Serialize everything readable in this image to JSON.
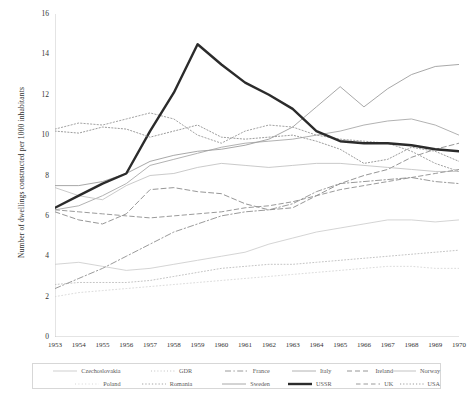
{
  "chart_data": {
    "type": "line",
    "title": "",
    "xlabel": "",
    "ylabel": "Number of dwellings constructed per 1000 inhabitants",
    "x": [
      1953,
      1954,
      1955,
      1956,
      1957,
      1958,
      1959,
      1960,
      1961,
      1962,
      1963,
      1964,
      1965,
      1966,
      1967,
      1968,
      1969,
      1970
    ],
    "xtick_labels": [
      "1953",
      "1954",
      "1955",
      "1956",
      "1957",
      "1958",
      "1959",
      "1960",
      "1961",
      "1962",
      "1963",
      "1964",
      "1965",
      "1966",
      "1967",
      "1968",
      "1969",
      "1970"
    ],
    "ylim": [
      0,
      16
    ],
    "ytick_labels": [
      "0",
      "2",
      "4",
      "6",
      "8",
      "10",
      "12",
      "14",
      "16"
    ],
    "yticks": [
      0,
      2,
      4,
      6,
      8,
      10,
      12,
      14,
      16
    ],
    "grid": false,
    "legend_position": "below-plot",
    "series": [
      {
        "name": "Czechoslovakia",
        "style": "solid-light",
        "color": "#c9c9c9",
        "width": 0.8,
        "values": [
          3.6,
          3.7,
          3.5,
          3.3,
          3.4,
          3.6,
          3.8,
          4.0,
          4.2,
          4.6,
          4.9,
          5.2,
          5.4,
          5.6,
          5.8,
          5.8,
          5.7,
          5.8
        ]
      },
      {
        "name": "GDR",
        "style": "dotted-light",
        "color": "#bdbdbd",
        "width": 0.9,
        "values": [
          2.6,
          2.7,
          2.7,
          2.7,
          2.8,
          3.0,
          3.2,
          3.4,
          3.5,
          3.6,
          3.6,
          3.7,
          3.8,
          3.9,
          4.0,
          4.1,
          4.2,
          4.3
        ]
      },
      {
        "name": "France",
        "style": "dashdot",
        "color": "#8f8f8f",
        "width": 0.9,
        "values": [
          2.4,
          2.9,
          3.4,
          4.0,
          4.6,
          5.2,
          5.6,
          6.0,
          6.2,
          6.3,
          6.6,
          7.2,
          7.6,
          7.7,
          7.8,
          7.9,
          7.7,
          7.6
        ]
      },
      {
        "name": "Italy",
        "style": "solid-mid",
        "color": "#a9a9a9",
        "width": 0.9,
        "values": [
          6.3,
          6.5,
          7.0,
          7.6,
          8.5,
          8.8,
          9.1,
          9.4,
          9.6,
          9.7,
          9.8,
          10.0,
          10.2,
          10.5,
          10.7,
          10.8,
          10.5,
          10.0
        ]
      },
      {
        "name": "Ireland",
        "style": "dashed",
        "color": "#8a8a8a",
        "width": 0.9,
        "values": [
          6.2,
          5.8,
          5.6,
          6.1,
          7.3,
          7.4,
          7.2,
          7.1,
          6.6,
          6.3,
          6.4,
          7.0,
          7.6,
          8.0,
          8.3,
          8.9,
          9.3,
          9.6
        ]
      },
      {
        "name": "Norway",
        "style": "solid-thin",
        "color": "#bcbcbc",
        "width": 0.8,
        "values": [
          7.4,
          7.0,
          6.8,
          7.5,
          8.0,
          8.1,
          8.4,
          8.6,
          8.5,
          8.4,
          8.5,
          8.6,
          8.6,
          8.5,
          8.4,
          8.3,
          8.2,
          8.2
        ]
      },
      {
        "name": "Poland",
        "style": "dotted-faint",
        "color": "#d2d2d2",
        "width": 0.8,
        "values": [
          2.0,
          2.2,
          2.3,
          2.4,
          2.5,
          2.6,
          2.7,
          2.8,
          2.9,
          3.0,
          3.1,
          3.2,
          3.3,
          3.4,
          3.5,
          3.5,
          3.4,
          3.4
        ]
      },
      {
        "name": "Romania",
        "style": "dotted-mid",
        "color": "#a5a5a5",
        "width": 1.0,
        "values": [
          10.3,
          10.6,
          10.5,
          10.8,
          11.1,
          10.8,
          10.0,
          9.6,
          10.2,
          10.5,
          10.4,
          10.0,
          9.8,
          9.7,
          9.6,
          9.2,
          8.6,
          8.2
        ]
      },
      {
        "name": "Sweden",
        "style": "solid-gray",
        "color": "#9e9e9e",
        "width": 0.9,
        "values": [
          7.5,
          7.5,
          7.7,
          8.1,
          8.7,
          9.0,
          9.2,
          9.3,
          9.5,
          9.8,
          10.4,
          11.4,
          12.4,
          11.4,
          12.3,
          13.0,
          13.4,
          13.5
        ]
      },
      {
        "name": "USSR",
        "style": "thick",
        "color": "#2b2b2b",
        "width": 2.4,
        "values": [
          6.4,
          7.0,
          7.6,
          8.1,
          10.2,
          12.1,
          14.5,
          13.5,
          12.6,
          12.0,
          11.3,
          10.2,
          9.7,
          9.6,
          9.6,
          9.5,
          9.3,
          9.2
        ]
      },
      {
        "name": "UK",
        "style": "dashed-mid",
        "color": "#8f8f8f",
        "width": 0.9,
        "values": [
          6.3,
          6.2,
          6.1,
          6.0,
          5.9,
          6.0,
          6.1,
          6.2,
          6.4,
          6.5,
          6.7,
          7.0,
          7.3,
          7.5,
          7.7,
          7.9,
          8.1,
          8.3
        ]
      },
      {
        "name": "USA",
        "style": "dotted-dark",
        "color": "#9c9c9c",
        "width": 1.0,
        "values": [
          10.2,
          10.1,
          10.4,
          10.3,
          9.9,
          10.2,
          10.5,
          9.9,
          9.8,
          9.9,
          10.0,
          9.7,
          9.3,
          8.6,
          8.8,
          9.4,
          9.2,
          8.7
        ]
      }
    ]
  },
  "legend": {
    "rows": [
      [
        {
          "label": "Czechoslovakia",
          "series": "Czechoslovakia"
        },
        {
          "label": "GDR",
          "series": "GDR"
        },
        {
          "label": "France",
          "series": "France"
        },
        {
          "label": "Italy",
          "series": "Italy"
        },
        {
          "label": "Ireland",
          "series": "Ireland"
        },
        {
          "label": "Norway",
          "series": "Norway"
        }
      ],
      [
        {
          "label": "Poland",
          "series": "Poland"
        },
        {
          "label": "Romania",
          "series": "Romania"
        },
        {
          "label": "Sweden",
          "series": "Sweden"
        },
        {
          "label": "USSR",
          "series": "USSR"
        },
        {
          "label": "UK",
          "series": "UK"
        },
        {
          "label": "USA",
          "series": "USA"
        }
      ]
    ]
  }
}
